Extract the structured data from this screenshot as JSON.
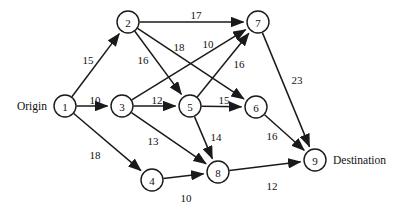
{
  "diagram": {
    "type": "directed-weighted-graph",
    "width": 400,
    "height": 217,
    "background_color": "#ffffff",
    "line_color": "#1a1a1a",
    "text_color": "#111111"
  },
  "terminals": {
    "origin_label": "Origin",
    "destination_label": "Destination"
  },
  "nodes": [
    {
      "id": "1",
      "label": "1",
      "x": 65,
      "y": 106,
      "r": 11
    },
    {
      "id": "2",
      "label": "2",
      "x": 128,
      "y": 22,
      "r": 11
    },
    {
      "id": "3",
      "label": "3",
      "x": 122,
      "y": 106,
      "r": 11
    },
    {
      "id": "4",
      "label": "4",
      "x": 152,
      "y": 180,
      "r": 11
    },
    {
      "id": "5",
      "label": "5",
      "x": 190,
      "y": 106,
      "r": 11
    },
    {
      "id": "6",
      "label": "6",
      "x": 256,
      "y": 107,
      "r": 11
    },
    {
      "id": "7",
      "label": "7",
      "x": 258,
      "y": 22,
      "r": 11
    },
    {
      "id": "8",
      "label": "8",
      "x": 218,
      "y": 172,
      "r": 11
    },
    {
      "id": "9",
      "label": "9",
      "x": 315,
      "y": 160,
      "r": 11
    }
  ],
  "edges": [
    {
      "from": "1",
      "to": "2",
      "weight": "15",
      "lx": 88,
      "ly": 60
    },
    {
      "from": "1",
      "to": "3",
      "weight": "10",
      "lx": 95,
      "ly": 100
    },
    {
      "from": "1",
      "to": "4",
      "weight": "18",
      "lx": 95,
      "ly": 155
    },
    {
      "from": "2",
      "to": "7",
      "weight": "17",
      "lx": 196,
      "ly": 15
    },
    {
      "from": "2",
      "to": "5",
      "weight": "16",
      "lx": 143,
      "ly": 60
    },
    {
      "from": "2",
      "to": "6",
      "weight": "18",
      "lx": 179,
      "ly": 47
    },
    {
      "from": "3",
      "to": "5",
      "weight": "12",
      "lx": 157,
      "ly": 100
    },
    {
      "from": "3",
      "to": "7",
      "weight": "10",
      "lx": 208,
      "ly": 44
    },
    {
      "from": "3",
      "to": "8",
      "weight": "13",
      "lx": 153,
      "ly": 141
    },
    {
      "from": "4",
      "to": "8",
      "weight": "10",
      "lx": 186,
      "ly": 198
    },
    {
      "from": "5",
      "to": "6",
      "weight": "15",
      "lx": 224,
      "ly": 100
    },
    {
      "from": "5",
      "to": "7",
      "weight": "16",
      "lx": 239,
      "ly": 64
    },
    {
      "from": "5",
      "to": "8",
      "weight": "14",
      "lx": 216,
      "ly": 137
    },
    {
      "from": "6",
      "to": "9",
      "weight": "16",
      "lx": 272,
      "ly": 136
    },
    {
      "from": "7",
      "to": "9",
      "weight": "23",
      "lx": 297,
      "ly": 80
    },
    {
      "from": "8",
      "to": "9",
      "weight": "12",
      "lx": 272,
      "ly": 186
    }
  ],
  "chart_data": {
    "type": "diagram",
    "node_ids": [
      "1",
      "2",
      "3",
      "4",
      "5",
      "6",
      "7",
      "8",
      "9"
    ],
    "origin_node": "1",
    "destination_node": "9",
    "edge_list": [
      [
        "1",
        "2",
        15
      ],
      [
        "1",
        "3",
        10
      ],
      [
        "1",
        "4",
        18
      ],
      [
        "2",
        "7",
        17
      ],
      [
        "2",
        "5",
        16
      ],
      [
        "2",
        "6",
        18
      ],
      [
        "3",
        "5",
        12
      ],
      [
        "3",
        "7",
        10
      ],
      [
        "3",
        "8",
        13
      ],
      [
        "4",
        "8",
        10
      ],
      [
        "5",
        "6",
        15
      ],
      [
        "5",
        "7",
        16
      ],
      [
        "5",
        "8",
        14
      ],
      [
        "6",
        "9",
        16
      ],
      [
        "7",
        "9",
        23
      ],
      [
        "8",
        "9",
        12
      ]
    ]
  }
}
